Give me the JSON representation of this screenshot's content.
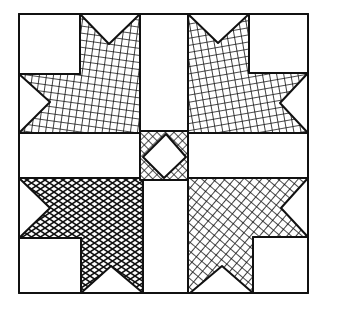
{
  "figure": {
    "colors": {
      "ink": "#111111",
      "paper": "#ffffff"
    },
    "frame": {
      "x": 19,
      "y": 14,
      "width": 289,
      "height": 279
    },
    "pieces": [
      {
        "name": "top-left-star",
        "fill": "crosshatch-grid"
      },
      {
        "name": "top-right-star",
        "fill": "crosshatch-grid"
      },
      {
        "name": "bottom-left-star",
        "fill": "crosshatch-diamond"
      },
      {
        "name": "bottom-right-star",
        "fill": "crosshatch-diagonal"
      },
      {
        "name": "center-square",
        "fill": "crosshatch-diagonal"
      },
      {
        "name": "center-diamond",
        "fill": "white"
      }
    ]
  }
}
